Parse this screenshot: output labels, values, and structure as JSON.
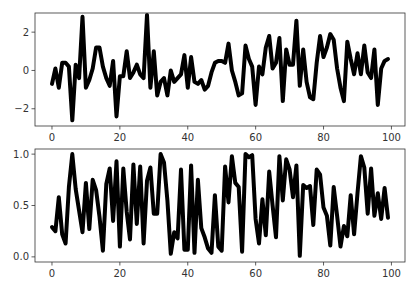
{
  "chart_data": [
    {
      "type": "line",
      "title": "",
      "xlabel": "",
      "ylabel": "",
      "xlim": [
        -5,
        104
      ],
      "ylim": [
        -2.9,
        3.0
      ],
      "xticks": [
        0,
        20,
        40,
        60,
        80,
        100
      ],
      "xtick_labels": [
        "0",
        "20",
        "40",
        "60",
        "80",
        "100"
      ],
      "yticks": [
        2,
        0,
        -2
      ],
      "ytick_labels": [
        "2",
        "0",
        "−2"
      ],
      "grid": false,
      "legend": null,
      "line_color": "#000000",
      "line_width": 4,
      "series": [
        {
          "name": "random normal",
          "x": [
            0,
            1,
            2,
            3,
            4,
            5,
            6,
            7,
            8,
            9,
            10,
            11,
            12,
            13,
            14,
            15,
            16,
            17,
            18,
            19,
            20,
            21,
            22,
            23,
            24,
            25,
            26,
            27,
            28,
            29,
            30,
            31,
            32,
            33,
            34,
            35,
            36,
            37,
            38,
            39,
            40,
            41,
            42,
            43,
            44,
            45,
            46,
            47,
            48,
            49,
            50,
            51,
            52,
            53,
            54,
            55,
            56,
            57,
            58,
            59,
            60,
            61,
            62,
            63,
            64,
            65,
            66,
            67,
            68,
            69,
            70,
            71,
            72,
            73,
            74,
            75,
            76,
            77,
            78,
            79,
            80,
            81,
            82,
            83,
            84,
            85,
            86,
            87,
            88,
            89,
            90,
            91,
            92,
            93,
            94,
            95,
            96,
            97,
            98,
            99
          ],
          "values": [
            -0.7,
            0.1,
            -0.9,
            0.4,
            0.4,
            0.2,
            -2.6,
            0.3,
            -0.4,
            2.8,
            -0.9,
            -0.5,
            0.1,
            1.2,
            1.2,
            0.2,
            -0.4,
            -0.8,
            0.5,
            -2.4,
            -0.3,
            -0.3,
            1.0,
            -0.4,
            -0.1,
            0.3,
            -0.2,
            -0.4,
            2.9,
            -0.9,
            1.0,
            -1.3,
            -0.6,
            -0.4,
            -1.3,
            0.0,
            -0.6,
            -0.4,
            -0.2,
            0.8,
            -0.9,
            0.7,
            -0.6,
            -0.7,
            -0.5,
            -1.0,
            -0.8,
            -0.1,
            0.4,
            0.5,
            0.5,
            0.4,
            1.4,
            0.0,
            -0.6,
            -1.3,
            -1.2,
            1.3,
            0.6,
            0.2,
            -1.8,
            0.2,
            -0.2,
            1.2,
            1.8,
            0.1,
            0.4,
            1.7,
            -1.6,
            1.1,
            0.3,
            0.3,
            2.6,
            -0.8,
            1.1,
            -0.6,
            -1.4,
            -1.5,
            0.4,
            1.8,
            0.7,
            1.2,
            1.9,
            1.6,
            0.1,
            -0.9,
            -1.6,
            1.5,
            0.6,
            -0.2,
            0.9,
            -0.2,
            1.3,
            -0.1,
            -0.4,
            1.1,
            -1.8,
            0.1,
            0.5,
            0.6
          ]
        }
      ]
    },
    {
      "type": "line",
      "title": "",
      "xlabel": "",
      "ylabel": "",
      "xlim": [
        -5,
        104
      ],
      "ylim": [
        -0.05,
        1.05
      ],
      "xticks": [
        0,
        20,
        40,
        60,
        80,
        100
      ],
      "xtick_labels": [
        "0",
        "20",
        "40",
        "60",
        "80",
        "100"
      ],
      "yticks": [
        1.0,
        0.5,
        0.0
      ],
      "ytick_labels": [
        "1.0",
        "0.5",
        "0.0"
      ],
      "grid": false,
      "legend": null,
      "line_color": "#000000",
      "line_width": 4,
      "series": [
        {
          "name": "random uniform",
          "x": [
            0,
            1,
            2,
            3,
            4,
            5,
            6,
            7,
            8,
            9,
            10,
            11,
            12,
            13,
            14,
            15,
            16,
            17,
            18,
            19,
            20,
            21,
            22,
            23,
            24,
            25,
            26,
            27,
            28,
            29,
            30,
            31,
            32,
            33,
            34,
            35,
            36,
            37,
            38,
            39,
            40,
            41,
            42,
            43,
            44,
            45,
            46,
            47,
            48,
            49,
            50,
            51,
            52,
            53,
            54,
            55,
            56,
            57,
            58,
            59,
            60,
            61,
            62,
            63,
            64,
            65,
            66,
            67,
            68,
            69,
            70,
            71,
            72,
            73,
            74,
            75,
            76,
            77,
            78,
            79,
            80,
            81,
            82,
            83,
            84,
            85,
            86,
            87,
            88,
            89,
            90,
            91,
            92,
            93,
            94,
            95,
            96,
            97,
            98,
            99
          ],
          "values": [
            0.29,
            0.25,
            0.58,
            0.22,
            0.13,
            0.68,
            1.0,
            0.66,
            0.45,
            0.24,
            0.72,
            0.27,
            0.75,
            0.65,
            0.39,
            0.06,
            0.71,
            0.86,
            0.35,
            0.93,
            0.1,
            0.86,
            0.44,
            0.17,
            0.9,
            0.32,
            0.88,
            0.13,
            0.74,
            0.87,
            0.42,
            0.42,
            1.0,
            0.92,
            0.55,
            0.03,
            0.24,
            0.18,
            0.85,
            0.07,
            0.07,
            0.89,
            0.04,
            0.75,
            0.28,
            0.19,
            0.08,
            0.04,
            0.6,
            0.1,
            0.06,
            0.88,
            0.53,
            0.98,
            0.72,
            0.68,
            0.05,
            1.0,
            0.97,
            0.99,
            0.37,
            0.13,
            0.56,
            0.21,
            0.83,
            0.5,
            0.19,
            0.98,
            0.55,
            0.95,
            0.85,
            0.58,
            0.89,
            0.01,
            0.7,
            0.67,
            0.69,
            0.31,
            0.85,
            0.8,
            0.48,
            0.4,
            0.11,
            0.68,
            0.4,
            0.1,
            0.3,
            0.2,
            0.6,
            0.22,
            0.62,
            0.98,
            0.87,
            0.42,
            0.86,
            0.4,
            0.62,
            0.37,
            0.67,
            0.38
          ]
        }
      ]
    }
  ]
}
